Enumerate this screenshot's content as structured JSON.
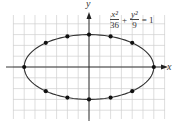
{
  "chart_data": {
    "type": "scatter",
    "title": "",
    "equation": {
      "x_term_num": "x²",
      "x_term_den": "36",
      "plus": "+",
      "y_term_num": "y²",
      "y_term_den": "9",
      "equals": "= 1"
    },
    "xlabel": "x",
    "ylabel": "y",
    "curve": {
      "kind": "ellipse",
      "a": 6,
      "b": 3,
      "center": [
        0,
        0
      ]
    },
    "points": [
      {
        "x": -6,
        "y": 0
      },
      {
        "x": -4,
        "y": 2.24
      },
      {
        "x": -2,
        "y": 2.83
      },
      {
        "x": 0,
        "y": 3
      },
      {
        "x": 2,
        "y": 2.83
      },
      {
        "x": 4,
        "y": 2.24
      },
      {
        "x": 6,
        "y": 0
      },
      {
        "x": 4,
        "y": -2.24
      },
      {
        "x": 2,
        "y": -2.83
      },
      {
        "x": 0,
        "y": -3
      },
      {
        "x": -2,
        "y": -2.83
      },
      {
        "x": -4,
        "y": -2.24
      }
    ],
    "xlim": [
      -7,
      7
    ],
    "ylim": [
      -4.5,
      4.8
    ],
    "grid": true,
    "colors": {
      "grid": "#d0d0d0",
      "axis": "#222222",
      "curve": "#333333",
      "point": "#111111"
    }
  }
}
